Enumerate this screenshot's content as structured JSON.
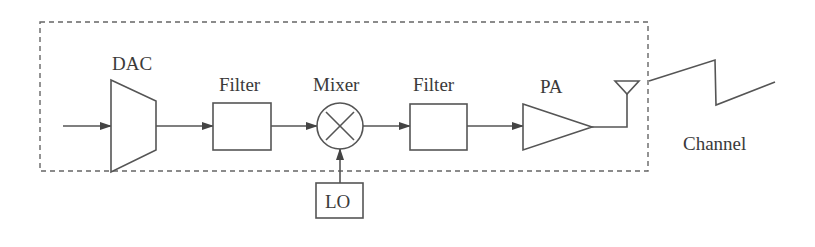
{
  "diagram": {
    "blocks": [
      {
        "id": "dac",
        "label": "DAC",
        "shape": "trapezoid"
      },
      {
        "id": "filter1",
        "label": "Filter",
        "shape": "rectangle"
      },
      {
        "id": "mixer",
        "label": "Mixer",
        "shape": "circle-x"
      },
      {
        "id": "filter2",
        "label": "Filter",
        "shape": "rectangle"
      },
      {
        "id": "pa",
        "label": "PA",
        "shape": "triangle"
      },
      {
        "id": "lo",
        "label": "LO",
        "shape": "rectangle"
      },
      {
        "id": "antenna",
        "label": "",
        "shape": "antenna-triangle"
      }
    ],
    "channel_label": "Channel",
    "connections": [
      [
        "input",
        "dac"
      ],
      [
        "dac",
        "filter1"
      ],
      [
        "filter1",
        "mixer"
      ],
      [
        "lo",
        "mixer"
      ],
      [
        "mixer",
        "filter2"
      ],
      [
        "filter2",
        "pa"
      ],
      [
        "pa",
        "antenna"
      ],
      [
        "antenna",
        "channel"
      ]
    ],
    "colors": {
      "line": "#555555",
      "text": "#3a3a3a",
      "background": "#ffffff"
    }
  }
}
